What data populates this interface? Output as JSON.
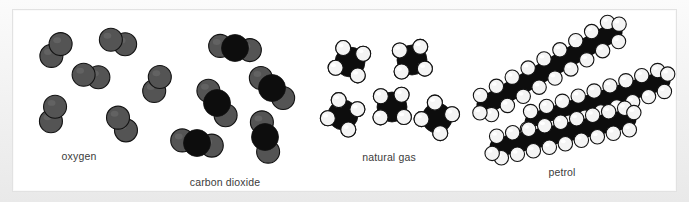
{
  "figure": {
    "background_color": "#ffffff",
    "mat_color": "#f0f0f0",
    "border_color": "#e2e2e2"
  },
  "atom_colors": {
    "oxygen": "#545454",
    "carbon": "#0d0d0d",
    "hydrogen": "#f4f4f4",
    "outline": "#121212"
  },
  "groups": [
    {
      "id": "oxygen",
      "label": "oxygen",
      "label_x": 66,
      "label_y": 146,
      "formula": "O2",
      "molecule_count": 6,
      "atoms_per_molecule": 2,
      "description": "diatomic oxygen molecules, two gray spheres each",
      "molecules": [
        {
          "cx": 43,
          "cy": 40,
          "angle": 128
        },
        {
          "cx": 105,
          "cy": 32,
          "angle": 18
        },
        {
          "cx": 78,
          "cy": 66,
          "angle": 10
        },
        {
          "cx": 144,
          "cy": 74,
          "angle": 112
        },
        {
          "cx": 40,
          "cy": 104,
          "angle": 106
        },
        {
          "cx": 109,
          "cy": 114,
          "angle": 58
        }
      ]
    },
    {
      "id": "carbon-dioxide",
      "label": "carbon dioxide",
      "label_x": 212,
      "label_y": 172,
      "formula": "CO2",
      "molecule_count": 5,
      "atoms_per_molecule": 3,
      "description": "linear CO2, black carbon centre flanked by two gray oxygen spheres",
      "molecules": [
        {
          "cx": 222,
          "cy": 38,
          "angle": 8
        },
        {
          "cx": 259,
          "cy": 78,
          "angle": 42
        },
        {
          "cx": 204,
          "cy": 93,
          "angle": 55
        },
        {
          "cx": 252,
          "cy": 127,
          "angle": 78
        },
        {
          "cx": 184,
          "cy": 133,
          "angle": 10
        }
      ]
    },
    {
      "id": "natural-gas",
      "label": "natural gas",
      "label_x": 376,
      "label_y": 147,
      "formula": "CH4",
      "molecule_count": 5,
      "atoms_per_molecule": 5,
      "description": "methane, black carbon centre with four white hydrogen spheres",
      "molecules": [
        {
          "cx": 337,
          "cy": 52,
          "angle": 12
        },
        {
          "cx": 399,
          "cy": 50,
          "angle": -14
        },
        {
          "cx": 330,
          "cy": 105,
          "angle": 22
        },
        {
          "cx": 379,
          "cy": 97,
          "angle": -8
        },
        {
          "cx": 424,
          "cy": 108,
          "angle": 30
        }
      ]
    },
    {
      "id": "petrol",
      "label": "petrol",
      "label_x": 549,
      "label_y": 162,
      "formula": "long-chain hydrocarbon",
      "molecule_count": 3,
      "description": "long hydrocarbon chains, black carbon backbone with white hydrogen spheres above and below",
      "chains": [
        {
          "x1": 473,
          "y1": 95,
          "x2": 600,
          "y2": 22,
          "carbons": 9
        },
        {
          "x1": 521,
          "y1": 112,
          "x2": 648,
          "y2": 71,
          "carbons": 9
        },
        {
          "x1": 486,
          "y1": 137,
          "x2": 614,
          "y2": 109,
          "carbons": 9
        }
      ]
    }
  ]
}
